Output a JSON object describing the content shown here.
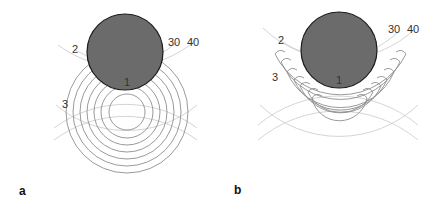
{
  "figure": {
    "panels": [
      {
        "id": "a",
        "label": "a",
        "annotations": {
          "top_ring": "2",
          "mid_ring": "3",
          "obstacle": "1",
          "arc_inner": "30",
          "arc_outer": "40"
        },
        "obstacle_color": "#6b6b6b",
        "description": "Concentric circular wavefronts centered below a dark circular obstacle; wavefronts pass through the obstacle"
      },
      {
        "id": "b",
        "label": "b",
        "annotations": {
          "top_ring": "2",
          "mid_ring": "3",
          "obstacle": "1",
          "arc_inner": "30",
          "arc_outer": "40"
        },
        "obstacle_color": "#6b6b6b",
        "description": "Wavefronts blocked by the dark circular obstacle, forming curled hook ends near the obstacle edge"
      }
    ]
  },
  "colors": {
    "wave_dark": "#8a8a8a",
    "wave_light": "#c8c8c8",
    "obstacle_fill": "#6b6b6b",
    "obstacle_stroke": "#1a1a1a"
  }
}
